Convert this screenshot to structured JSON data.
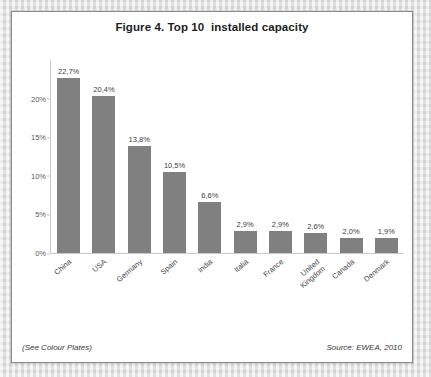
{
  "figure": {
    "title": "Figure 4. Top 10  installed capacity",
    "note_left": "(See Colour Plates)",
    "source_right": "Source: EWEA, 2010"
  },
  "colors": {
    "bar_fill": "#808080",
    "axis_line": "#c8c8c8",
    "border": "#8c8c8c",
    "page_background": "#dcdcdc",
    "panel_background": "#ffffff",
    "title_text": "#1d1d1d",
    "label_text": "#4a4a4a"
  },
  "chart_data": {
    "type": "bar",
    "title": "Figure 4. Top 10  installed capacity",
    "xlabel": "",
    "ylabel": "",
    "ylim": [
      0,
      25
    ],
    "grid": false,
    "legend": "none",
    "yticks": [
      "0%",
      "5%",
      "10%",
      "15%",
      "20%"
    ],
    "ytick_values": [
      0,
      5,
      10,
      15,
      20
    ],
    "categories": [
      "China",
      "USA",
      "Germany",
      "Spain",
      "India",
      "Italia",
      "France",
      "United\nKingdom",
      "Canada",
      "Denmark"
    ],
    "values": [
      22.7,
      20.4,
      13.8,
      10.5,
      6.6,
      2.9,
      2.9,
      2.6,
      2.0,
      1.9
    ],
    "data_labels": [
      "22,7%",
      "20,4%",
      "13,8%",
      "10,5%",
      "6,6%",
      "2,9%",
      "2,9%",
      "2,6%",
      "2,0%",
      "1,9%"
    ],
    "annotations": [
      "(See Colour Plates)",
      "Source: EWEA, 2010"
    ]
  }
}
